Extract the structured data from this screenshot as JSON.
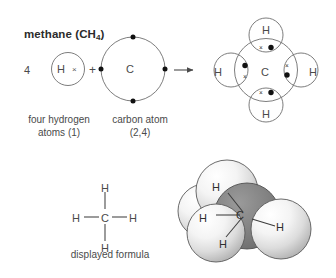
{
  "figure": {
    "title": "methane (CH",
    "title_sub": "4",
    "title_close": ")",
    "background_color": "#ffffff",
    "ink_color": "#4a4a4a"
  },
  "equation": {
    "multiplier": "4",
    "hydrogen_symbol": "H",
    "hydrogen_electron": "×",
    "plus": "+",
    "carbon_symbol": "C",
    "arrow": "→",
    "carbon_electron": "●",
    "captions": {
      "hydrogen": "four hydrogen atoms (1)",
      "hydrogen_line1": "four hydrogen",
      "hydrogen_line2": "atoms (1)",
      "carbon": "carbon atom (2,4)",
      "carbon_line1": "carbon atom",
      "carbon_line2": "(2,4)"
    }
  },
  "methane_molecule": {
    "center_symbol": "C",
    "hydrogen_top": "H",
    "hydrogen_bottom": "H",
    "hydrogen_left": "H",
    "hydrogen_right": "H",
    "shared_pair_cross": "×",
    "shared_pair_dot": "●",
    "bond_count": 4
  },
  "displayed_formula": {
    "caption": "displayed formula",
    "center": "C",
    "top": "H",
    "bottom": "H",
    "left": "H",
    "right": "H",
    "bond_symbol": "—"
  },
  "space_filling_model": {
    "carbon_label": "C",
    "hydrogen_top": "H",
    "hydrogen_left": "H",
    "hydrogen_bottom_left": "H",
    "hydrogen_right": "H",
    "carbon_color": "#7d7d7d",
    "hydrogen_color": "#e8e8e8",
    "outline_color": "#5a5a5a"
  }
}
